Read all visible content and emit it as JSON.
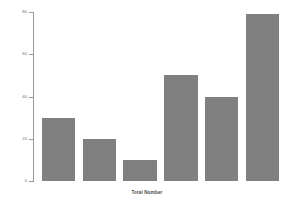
{
  "chart_data": {
    "type": "bar",
    "title": "",
    "subtitle": "",
    "xlabel": "Total Number",
    "ylabel": "",
    "categories": [
      "1",
      "2",
      "3",
      "4",
      "5",
      "6"
    ],
    "values": [
      30,
      20,
      10,
      50,
      40,
      79
    ],
    "ylim": [
      0,
      80
    ],
    "yticks": [
      0,
      20,
      40,
      60,
      80
    ],
    "ytick_labels": [
      "0",
      "20",
      "40",
      "60",
      "80"
    ],
    "xticks": [],
    "xtick_labels": [],
    "grid": false,
    "legend": false,
    "legend_position": "none",
    "bar_color": "#808080",
    "axis_color": "#9a9a9a",
    "background_color": "#ffffff",
    "annotations": []
  },
  "axis": {
    "x_title": "Total Number"
  }
}
